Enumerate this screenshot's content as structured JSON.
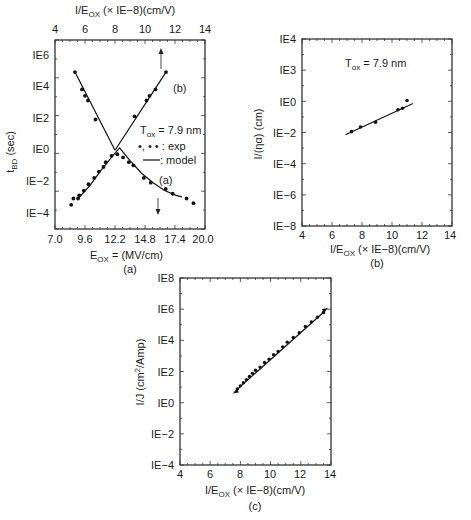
{
  "chart_data": [
    {
      "id": "a",
      "type": "scatter",
      "caption": "(a)",
      "title": "",
      "xlabel_bottom": "E_OX = (MV/cm)",
      "xlabel_top": "I/E_OX (× IE−8)(cm/V)",
      "ylabel": "t_BD (sec)",
      "x_bottom_ticks": [
        "7.0",
        "9.6",
        "12.2",
        "14.8",
        "17.4",
        "20.0"
      ],
      "x_bottom_range": [
        7.0,
        20.0
      ],
      "x_top_ticks": [
        "4",
        "6",
        "8",
        "10",
        "12",
        "14"
      ],
      "x_top_range": [
        4,
        14
      ],
      "y_ticks": [
        "IE6",
        "IE4",
        "IE2",
        "IE0",
        "IE−2",
        "IE−4"
      ],
      "y_scale": "log10",
      "y_range_log": [
        -5,
        6.9
      ],
      "annotation": "T_ox = 7.9 nm",
      "legend": [
        {
          "symbol": "•, • •",
          "label": ": exp"
        },
        {
          "symbol": "—",
          "label": ": model"
        }
      ],
      "series": [
        {
          "name": "(a) t_BD vs E_OX (bottom axis)",
          "axis": "bottom",
          "x": [
            8.4,
            8.6,
            9.0,
            9.1,
            9.5,
            9.9,
            10.4,
            10.8,
            11.2,
            11.4,
            11.9,
            12.4,
            12.9,
            13.4,
            13.8,
            14.7,
            15.3,
            16.6,
            17.2,
            18.4,
            19.0
          ],
          "log_y": [
            -3.5,
            -3.1,
            -3.1,
            -2.9,
            -2.6,
            -2.2,
            -1.8,
            -1.4,
            -1.1,
            -0.8,
            -0.4,
            -0.3,
            -0.5,
            -0.8,
            -1.0,
            -1.8,
            -2.1,
            -2.5,
            -2.8,
            -3.1,
            -3.4
          ],
          "model_x": [
            9.0,
            10.0,
            11.0,
            12.0,
            12.6,
            13.5,
            14.5,
            15.5,
            16.5,
            17.5,
            18.0
          ],
          "model_log_y": [
            -3.1,
            -2.3,
            -1.3,
            -0.4,
            0.1,
            -0.7,
            -1.5,
            -2.1,
            -2.6,
            -2.9,
            -3.0
          ],
          "arrow": "down"
        },
        {
          "name": "(b) t_BD vs I/E_OX (top axis)",
          "axis": "top",
          "x": [
            5.33,
            5.8,
            6.0,
            6.2,
            6.7,
            9.3,
            10.1,
            10.3,
            10.7,
            11.4
          ],
          "log_y": [
            4.9,
            3.8,
            3.4,
            3.1,
            1.9,
            2.1,
            3.1,
            3.4,
            3.8,
            4.9
          ],
          "model_left_x": [
            5.33,
            8.0
          ],
          "model_left_log_y": [
            4.9,
            -0.05
          ],
          "model_right_x": [
            8.0,
            11.4
          ],
          "model_right_log_y": [
            -0.05,
            4.9
          ],
          "arrow": "up",
          "label": "(b)"
        }
      ]
    },
    {
      "id": "b",
      "type": "scatter",
      "caption": "(b)",
      "xlabel": "I/E_OX (× IE−8)(cm/V)",
      "ylabel": "I/(ηα) (cm)",
      "x_ticks": [
        "4",
        "6",
        "8",
        "10",
        "12",
        "14"
      ],
      "x_range": [
        4,
        14
      ],
      "y_ticks": [
        "IE4",
        "IE3",
        "IE0",
        "IE−2",
        "IE−4",
        "IE−6",
        "IE−8"
      ],
      "y_scale": "log10",
      "annotation": "T_ox = 7.9 nm",
      "series": [
        {
          "name": "exp",
          "x": [
            7.3,
            7.9,
            8.9,
            10.4,
            10.7,
            11.0
          ],
          "log_y": [
            -1.9,
            -1.6,
            -1.3,
            -0.5,
            -0.4,
            0.1
          ]
        },
        {
          "name": "model",
          "x": [
            6.9,
            11.4
          ],
          "log_y": [
            -2.1,
            -0.1
          ]
        }
      ]
    },
    {
      "id": "c",
      "type": "scatter",
      "caption": "(c)",
      "xlabel": "I/E_OX (× IE−8)(cm/V)",
      "ylabel": "I/J (cm²/Amp)",
      "x_ticks": [
        "4",
        "6",
        "8",
        "10",
        "12",
        "14"
      ],
      "x_range": [
        4,
        14
      ],
      "y_ticks": [
        "IE8",
        "IE6",
        "IE4",
        "IE2",
        "IE0",
        "IE−2",
        "IE−4"
      ],
      "y_scale": "log10",
      "y_range_log": [
        -4,
        8
      ],
      "series": [
        {
          "name": "exp",
          "x": [
            7.8,
            8.0,
            8.2,
            8.4,
            8.6,
            8.8,
            9.0,
            9.3,
            9.6,
            9.9,
            10.2,
            10.5,
            10.8,
            11.1,
            11.5,
            11.9,
            12.3,
            12.7,
            13.1,
            13.5
          ],
          "log_y": [
            0.9,
            1.1,
            1.3,
            1.5,
            1.7,
            1.9,
            2.1,
            2.3,
            2.6,
            2.8,
            3.1,
            3.3,
            3.6,
            3.9,
            4.2,
            4.5,
            4.9,
            5.2,
            5.5,
            5.8
          ]
        },
        {
          "name": "model",
          "x": [
            7.7,
            13.6
          ],
          "log_y": [
            0.8,
            5.9
          ]
        }
      ]
    }
  ],
  "labels": {
    "a": {
      "top_axis_title": "I/E",
      "top_axis_sub": "OX",
      "top_axis_rest": " (× IE−8)(cm/V)",
      "bottom_axis_title": "E",
      "bottom_axis_sub": "OX",
      "bottom_axis_rest": " = (MV/cm)",
      "caption": "(a)",
      "ylabel_main": "t",
      "ylabel_sub": "BD",
      "ylabel_rest": " (sec)",
      "tox_pre": "T",
      "tox_sub": "ox",
      "tox_rest": " = 7.9 nm",
      "legend_exp_sym": "•, • •",
      "legend_exp": " : exp",
      "legend_model": " : model",
      "curve_a": "(a)",
      "curve_b": "(b)"
    },
    "b": {
      "axis_title": "I/E",
      "axis_sub": "OX",
      "axis_rest": " (× IE−8)(cm/V)",
      "caption": "(b)",
      "ylabel": "I/(ηα) (cm)",
      "tox_pre": "T",
      "tox_sub": "ox",
      "tox_rest": " = 7.9 nm"
    },
    "c": {
      "axis_title": "I/E",
      "axis_sub": "OX",
      "axis_rest": " (× IE−8)(cm/V)",
      "caption": "(c)",
      "ylabel_pre": "I/J (cm",
      "ylabel_sup": "2",
      "ylabel_post": "/Amp)"
    }
  },
  "ticks": {
    "a_top": [
      "4",
      "6",
      "8",
      "10",
      "12",
      "14"
    ],
    "a_bottom": [
      "7.0",
      "9.6",
      "12.2",
      "14.8",
      "17.4",
      "20.0"
    ],
    "a_y": [
      "IE6",
      "IE4",
      "IE2",
      "IE0",
      "IE−2",
      "IE−4"
    ],
    "b_x": [
      "4",
      "6",
      "8",
      "10",
      "12",
      "14"
    ],
    "b_y": [
      "IE4",
      "IE3",
      "IE0",
      "IE−2",
      "IE−4",
      "IE−6",
      "IE−8"
    ],
    "c_x": [
      "4",
      "6",
      "8",
      "10",
      "12",
      "14"
    ],
    "c_y": [
      "IE8",
      "IE6",
      "IE4",
      "IE2",
      "IE0",
      "IE−2",
      "IE−4"
    ]
  }
}
